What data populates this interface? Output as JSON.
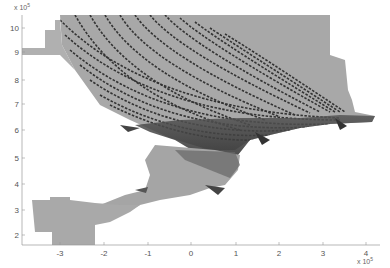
{
  "figure": {
    "type": "mesh-map",
    "x_axis": {
      "ticks": [
        "-3",
        "-2",
        "-1",
        "0",
        "1",
        "2",
        "3",
        "4"
      ],
      "multiplier": "x 10",
      "exponent": "5"
    },
    "y_axis": {
      "ticks": [
        "2",
        "3",
        "4",
        "5",
        "6",
        "7",
        "8",
        "9",
        "10"
      ],
      "multiplier": "x 10",
      "exponent": "5"
    },
    "colors": {
      "domain_fill": "#a9a9a9",
      "dense_mesh": "#3c3c3c",
      "grid_lines": "#2e2e2e",
      "axis": "#999999"
    }
  }
}
